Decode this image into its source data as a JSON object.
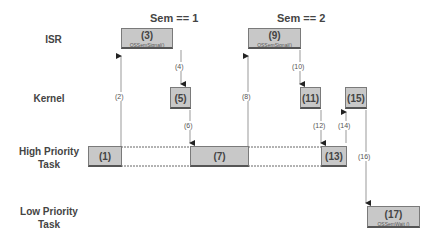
{
  "rows": {
    "isr": "ISR",
    "kernel": "Kernel",
    "high_1": "High Priority",
    "high_2": "Task",
    "low_1": "Low Priority",
    "low_2": "Task"
  },
  "headers": {
    "sem1": "Sem == 1",
    "sem2": "Sem == 2"
  },
  "boxes": {
    "b1": {
      "num": "(1)"
    },
    "b3": {
      "num": "(3)",
      "sub": "OSSemSignal()"
    },
    "b5": {
      "num": "(5)"
    },
    "b7": {
      "num": "(7)"
    },
    "b9": {
      "num": "(9)",
      "sub": "OSSemSignal()"
    },
    "b11": {
      "num": "(11)"
    },
    "b13": {
      "num": "(13)"
    },
    "b15": {
      "num": "(15)"
    },
    "b17": {
      "num": "(17)",
      "sub": "OSSemWait ()"
    }
  },
  "steps": {
    "s2": "(2)",
    "s4": "(4)",
    "s6": "(6)",
    "s8": "(8)",
    "s10": "(10)",
    "s12": "(12)",
    "s14": "(14)",
    "s16": "(16)"
  }
}
